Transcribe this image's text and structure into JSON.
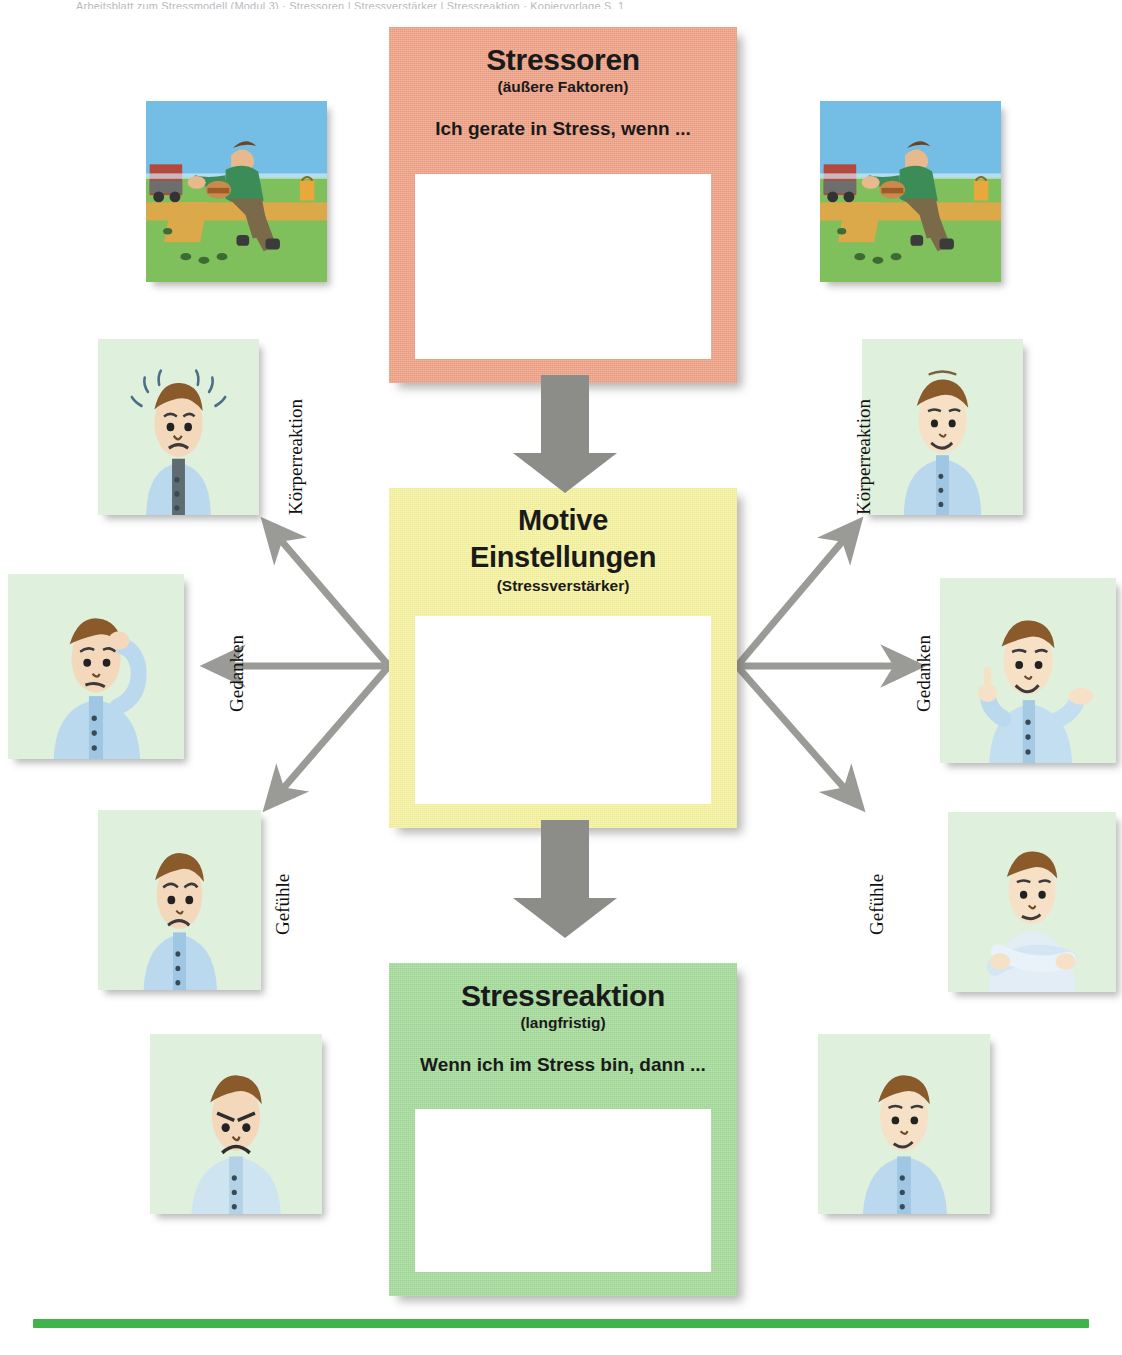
{
  "page": {
    "top_cropped_text": "Arbeitsblatt zum Stressmodell  (Modul 3)  ·  Stressoren  |  Stressverstärker  |  Stressreaktion  ·  Kopiervorlage  S. 1",
    "background_color": "#ffffff",
    "rule_color": "#3FB44B"
  },
  "boxes": {
    "stressoren": {
      "title": "Stressoren",
      "subtitle": "(äußere Faktoren)",
      "prompt": "Ich gerate in Stress, wenn ...",
      "color": "#F0A287",
      "write_area_value": ""
    },
    "motive": {
      "title_line1": "Motive",
      "title_line2": "Einstellungen",
      "subtitle": "(Stressverstärker)",
      "color": "#F7F4A0",
      "write_area_value": ""
    },
    "stressreaktion": {
      "title": "Stressreaktion",
      "subtitle": "(langfristig)",
      "prompt": "Wenn ich im Stress bin, dann ...",
      "color": "#A5DC9B",
      "write_area_value": ""
    }
  },
  "arrows": {
    "color": "#9A9A96",
    "down_top_label": "arrow-stressoren-to-motive",
    "down_bottom_label": "arrow-motive-to-stressreaktion",
    "spokes": [
      "motive-to-koerperreaktion-left",
      "motive-to-gedanken-left",
      "motive-to-gefuehle-left",
      "motive-to-koerperreaktion-right",
      "motive-to-gedanken-right",
      "motive-to-gefuehle-right"
    ]
  },
  "labels": {
    "koerperreaktion": "Körperreaktion",
    "gedanken": "Gedanken",
    "gefuehle": "Gefühle"
  },
  "illustrations": [
    {
      "id": "stressor-left",
      "caption": "Mann rennt hastig mit Hamburger, LKW im Hintergrund"
    },
    {
      "id": "stressor-right",
      "caption": "Mann rennt hastig mit Hamburger, LKW im Hintergrund"
    },
    {
      "id": "koerper-left",
      "caption": "Gestresster Mann mit Schweißtropfen"
    },
    {
      "id": "koerper-right",
      "caption": "Entspannter, lächelnder Mann"
    },
    {
      "id": "gedanken-left",
      "caption": "Mann kratzt sich ratlos am Kopf"
    },
    {
      "id": "gedanken-right",
      "caption": "Mann mit erhobenem Zeigefinger, zuversichtlich"
    },
    {
      "id": "gefuehle-left",
      "caption": "Angespannter Mann, besorgter Blick"
    },
    {
      "id": "gefuehle-right",
      "caption": "Mann mit verschränkten Armen, gelassen"
    },
    {
      "id": "reaktion-left",
      "caption": "Verärgerter Mann, finsterer Blick"
    },
    {
      "id": "reaktion-right",
      "caption": "Zufriedener Mann, leichtes Lächeln"
    }
  ]
}
